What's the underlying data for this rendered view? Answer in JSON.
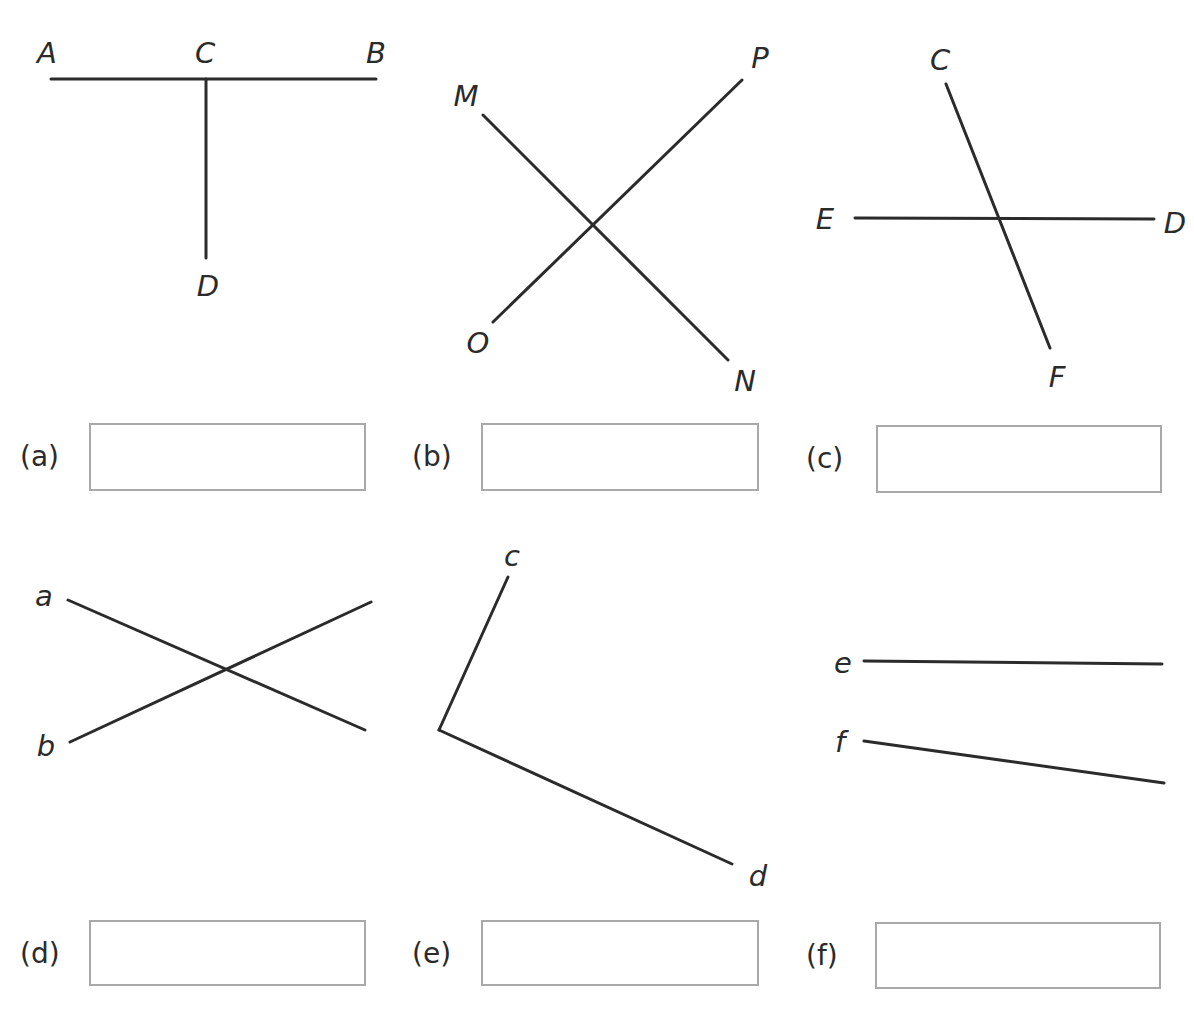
{
  "parts": [
    {
      "id": "a",
      "tag": "(a)",
      "points": [
        {
          "label": "A",
          "x": 47,
          "y": 63
        },
        {
          "label": "C",
          "x": 205,
          "y": 63
        },
        {
          "label": "B",
          "x": 376,
          "y": 63
        },
        {
          "label": "D",
          "x": 208,
          "y": 296
        }
      ],
      "segments": [
        [
          51,
          79,
          376,
          79
        ],
        [
          206,
          79,
          206,
          258
        ]
      ],
      "box": {
        "x": 89,
        "y": 423,
        "w": 277,
        "h": 68
      },
      "tag_pos": {
        "x": 20,
        "y": 440
      }
    },
    {
      "id": "b",
      "tag": "(b)",
      "points": [
        {
          "label": "M",
          "x": 466,
          "y": 106
        },
        {
          "label": "P",
          "x": 760,
          "y": 68
        },
        {
          "label": "O",
          "x": 478,
          "y": 353
        },
        {
          "label": "N",
          "x": 745,
          "y": 391
        }
      ],
      "segments": [
        [
          483,
          115,
          728,
          360
        ],
        [
          493,
          322,
          742,
          80
        ]
      ],
      "box": {
        "x": 481,
        "y": 423,
        "w": 278,
        "h": 68
      },
      "tag_pos": {
        "x": 412,
        "y": 440
      }
    },
    {
      "id": "c",
      "tag": "(c)",
      "points": [
        {
          "label": "C",
          "x": 940,
          "y": 70
        },
        {
          "label": "E",
          "x": 825,
          "y": 229
        },
        {
          "label": "D",
          "x": 1175,
          "y": 233
        },
        {
          "label": "F",
          "x": 1057,
          "y": 387
        }
      ],
      "segments": [
        [
          946,
          84,
          1050,
          348
        ],
        [
          855,
          218,
          1154,
          219
        ]
      ],
      "box": {
        "x": 876,
        "y": 425,
        "w": 286,
        "h": 68
      },
      "tag_pos": {
        "x": 806,
        "y": 442
      }
    },
    {
      "id": "d",
      "tag": "(d)",
      "points": [
        {
          "label": "a",
          "x": 44,
          "y": 606
        },
        {
          "label": "b",
          "x": 46,
          "y": 756
        }
      ],
      "segments": [
        [
          68,
          600,
          365,
          730
        ],
        [
          70,
          742,
          371,
          602
        ]
      ],
      "box": {
        "x": 89,
        "y": 920,
        "w": 277,
        "h": 66
      },
      "tag_pos": {
        "x": 20,
        "y": 937
      }
    },
    {
      "id": "e",
      "tag": "(e)",
      "points": [
        {
          "label": "c",
          "x": 512,
          "y": 566
        },
        {
          "label": "d",
          "x": 758,
          "y": 886
        }
      ],
      "segments": [
        [
          508,
          577,
          439,
          730
        ],
        [
          439,
          730,
          732,
          864
        ]
      ],
      "box": {
        "x": 481,
        "y": 920,
        "w": 278,
        "h": 66
      },
      "tag_pos": {
        "x": 412,
        "y": 937
      }
    },
    {
      "id": "f",
      "tag": "(f)",
      "points": [
        {
          "label": "e",
          "x": 843,
          "y": 673
        },
        {
          "label": "f",
          "x": 840,
          "y": 752
        }
      ],
      "segments": [
        [
          864,
          661,
          1162,
          664
        ],
        [
          864,
          741,
          1164,
          783
        ]
      ],
      "box": {
        "x": 875,
        "y": 922,
        "w": 286,
        "h": 67
      },
      "tag_pos": {
        "x": 806,
        "y": 939
      }
    }
  ],
  "colors": {
    "line": "#2b2b2b",
    "box_border": "#a9a9a9",
    "background": "#ffffff"
  }
}
